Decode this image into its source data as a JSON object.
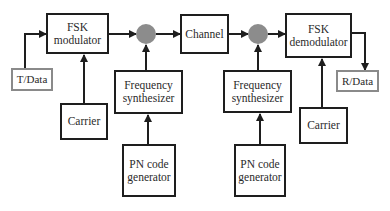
{
  "diagram": {
    "colors": {
      "line": "#1e1e1e",
      "io_border": "#8a8a8a",
      "mixer_fill": "#8c8c8c",
      "text": "#2a2a2a"
    },
    "blocks": {
      "fsk_modulator": {
        "label": "FSK\nmodulator"
      },
      "t_data": {
        "label": "T/Data"
      },
      "carrier_tx": {
        "label": "Carrier"
      },
      "freq_synth_tx": {
        "label": "Frequency\nsynthesizer"
      },
      "pn_gen_tx": {
        "label": "PN code\ngenerator"
      },
      "channel": {
        "label": "Channel"
      },
      "freq_synth_rx": {
        "label": "Frequency\nsynthesizer"
      },
      "pn_gen_rx": {
        "label": "PN code\ngenerator"
      },
      "fsk_demodulator": {
        "label": "FSK\ndemodulator"
      },
      "r_data": {
        "label": "R/Data"
      },
      "carrier_rx": {
        "label": "Carrier"
      }
    },
    "mixers": [
      {
        "id": "mixer_tx",
        "shape": "gray-circle"
      },
      {
        "id": "mixer_rx",
        "shape": "gray-circle"
      }
    ],
    "connections": [
      [
        "t_data",
        "fsk_modulator"
      ],
      [
        "carrier_tx",
        "fsk_modulator"
      ],
      [
        "fsk_modulator",
        "mixer_tx"
      ],
      [
        "freq_synth_tx",
        "mixer_tx"
      ],
      [
        "pn_gen_tx",
        "freq_synth_tx"
      ],
      [
        "mixer_tx",
        "channel"
      ],
      [
        "channel",
        "mixer_rx"
      ],
      [
        "freq_synth_rx",
        "mixer_rx"
      ],
      [
        "pn_gen_rx",
        "freq_synth_rx"
      ],
      [
        "mixer_rx",
        "fsk_demodulator"
      ],
      [
        "carrier_rx",
        "fsk_demodulator"
      ],
      [
        "fsk_demodulator",
        "r_data"
      ]
    ]
  }
}
